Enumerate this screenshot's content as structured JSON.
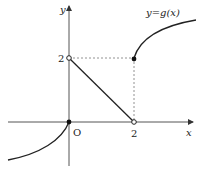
{
  "figure": {
    "type": "function-graph",
    "function_label": "y=g(x)",
    "axes": {
      "x_label": "x",
      "y_label": "y",
      "origin_label": "O"
    },
    "ticks": {
      "x_tick": "2",
      "y_tick": "2"
    },
    "pieces": [
      {
        "description": "curve for x < 0, concave, increasing to origin",
        "endpoint": {
          "x": 0,
          "y": 0,
          "closed": true
        }
      },
      {
        "description": "line segment from (0,2) to (2,0)",
        "start": {
          "x": 0,
          "y": 2,
          "closed": false
        },
        "end": {
          "x": 2,
          "y": 0,
          "closed": false
        }
      },
      {
        "description": "curve for x >= 2, increasing concave",
        "start": {
          "x": 2,
          "y": 2,
          "closed": true
        }
      }
    ],
    "guides": [
      "dashed horizontal y=2 from x=0 to x=2",
      "dashed vertical x=2 from y=0 to y=2"
    ],
    "colors": {
      "stroke": "#222222",
      "axis": "#555555",
      "background": "#ffffff"
    }
  }
}
